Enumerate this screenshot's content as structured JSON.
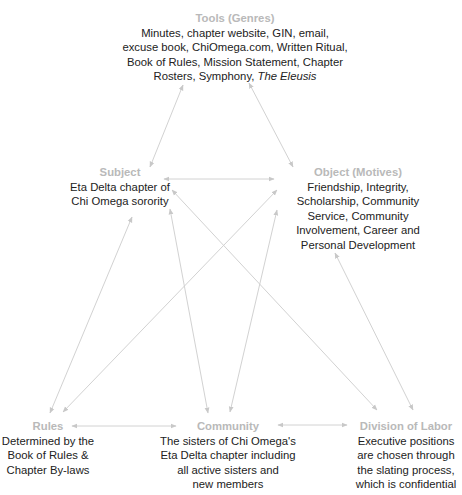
{
  "diagram": {
    "type": "activity-system-triangle",
    "arrow_color": "#cfcfcf",
    "title_color": "#b9b9b9",
    "text_color": "#222222",
    "nodes": {
      "tools": {
        "title": "Tools (Genres)",
        "lines": [
          "Minutes, chapter website, GIN, email,",
          "excuse book, ChiOmega.com, Written Ritual,",
          "Book of Rules, Mission Statement, Chapter",
          "Rosters, Symphony, "
        ],
        "italic_tail": "The Eleusis"
      },
      "subject": {
        "title": "Subject",
        "lines": [
          "Eta Delta chapter of",
          "Chi Omega sorority"
        ]
      },
      "object": {
        "title": "Object (Motives)",
        "lines": [
          "Friendship, Integrity,",
          "Scholarship, Community",
          "Service, Community",
          "Involvement, Career and",
          "Personal Development"
        ]
      },
      "rules": {
        "title": "Rules",
        "lines": [
          "Determined by the",
          "Book of Rules &",
          "Chapter By-laws"
        ]
      },
      "community": {
        "title": "Community",
        "lines": [
          "The sisters of Chi Omega's",
          "Eta Delta chapter including",
          "all active sisters and",
          "new members"
        ]
      },
      "division": {
        "title": "Division of Labor",
        "lines": [
          "Executive positions",
          "are chosen through",
          "the slating process,",
          "which is confidential"
        ]
      }
    },
    "connections": [
      {
        "from": "tools",
        "to": "subject"
      },
      {
        "from": "tools",
        "to": "object"
      },
      {
        "from": "subject",
        "to": "object"
      },
      {
        "from": "subject",
        "to": "rules"
      },
      {
        "from": "object",
        "to": "rules"
      },
      {
        "from": "subject",
        "to": "community"
      },
      {
        "from": "object",
        "to": "community"
      },
      {
        "from": "subject",
        "to": "division"
      },
      {
        "from": "object",
        "to": "division"
      },
      {
        "from": "rules",
        "to": "community"
      },
      {
        "from": "community",
        "to": "division"
      }
    ]
  }
}
